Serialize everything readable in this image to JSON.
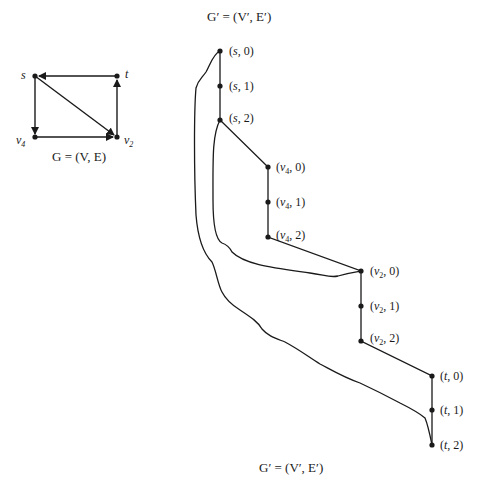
{
  "original_graph": {
    "caption": "G = (V, E)",
    "nodes": [
      {
        "id": "s",
        "label": "s",
        "x": 35,
        "y": 76
      },
      {
        "id": "t",
        "label": "t",
        "x": 117,
        "y": 76
      },
      {
        "id": "v4",
        "label": "v4",
        "x": 35,
        "y": 137
      },
      {
        "id": "v2",
        "label": "v2",
        "x": 117,
        "y": 137
      }
    ],
    "edges": [
      {
        "from": "t",
        "to": "s",
        "directed": true
      },
      {
        "from": "s",
        "to": "v4",
        "directed": true
      },
      {
        "from": "s",
        "to": "v2",
        "directed": true
      },
      {
        "from": "v4",
        "to": "v2",
        "directed": true
      },
      {
        "from": "v2",
        "to": "t",
        "directed": true
      }
    ]
  },
  "expanded_graph": {
    "caption_top": "G′ = (V′, E′)",
    "caption_bottom": "G′ = (V′, E′)",
    "nodes": [
      {
        "id": "s0",
        "label": "(s, 0)"
      },
      {
        "id": "s1",
        "label": "(s, 1)"
      },
      {
        "id": "s2",
        "label": "(s, 2)"
      },
      {
        "id": "v40",
        "label": "(v4, 0)"
      },
      {
        "id": "v41",
        "label": "(v4, 1)"
      },
      {
        "id": "v42",
        "label": "(v4, 2)"
      },
      {
        "id": "v20",
        "label": "(v2, 0)"
      },
      {
        "id": "v21",
        "label": "(v2, 1)"
      },
      {
        "id": "v22",
        "label": "(v2, 2)"
      },
      {
        "id": "t0",
        "label": "(t, 0)"
      },
      {
        "id": "t1",
        "label": "(t, 1)"
      },
      {
        "id": "t2",
        "label": "(t, 2)"
      }
    ],
    "edges": [
      [
        "s0",
        "s1"
      ],
      [
        "s1",
        "s2"
      ],
      [
        "s2",
        "v40"
      ],
      [
        "v40",
        "v41"
      ],
      [
        "v41",
        "v42"
      ],
      [
        "v42",
        "v20"
      ],
      [
        "v20",
        "v21"
      ],
      [
        "v21",
        "v22"
      ],
      [
        "v22",
        "t0"
      ],
      [
        "t0",
        "t1"
      ],
      [
        "t1",
        "t2"
      ],
      [
        "s2",
        "v20",
        "curved"
      ],
      [
        "s0",
        "t2",
        "curved"
      ]
    ]
  }
}
